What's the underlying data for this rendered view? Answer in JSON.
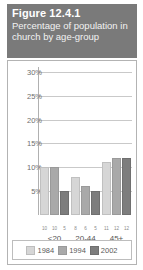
{
  "figure": {
    "number": "Figure 12.4.1",
    "subtitle": "Percentage of population in church by age-group"
  },
  "legend": {
    "items": [
      {
        "label": "1984",
        "color": "#d6d6d6",
        "name": "legend-item-1984"
      },
      {
        "label": "1994",
        "color": "#a9a9a9",
        "name": "legend-item-1994"
      },
      {
        "label": "2002",
        "color": "#7d7d7d",
        "name": "legend-item-2002"
      }
    ]
  },
  "chart_data": {
    "type": "bar",
    "title": "Percentage of population in church by age-group",
    "xlabel": "",
    "ylabel": "",
    "categories": [
      "<20",
      "20-44",
      "45+"
    ],
    "series": [
      {
        "name": "1984",
        "color": "#d6d6d6",
        "values": [
          10,
          8,
          11
        ]
      },
      {
        "name": "1994",
        "color": "#a9a9a9",
        "values": [
          10,
          6,
          12
        ]
      },
      {
        "name": "2002",
        "color": "#7d7d7d",
        "values": [
          5,
          5,
          12
        ]
      }
    ],
    "data_labels": [
      [
        "10",
        "10",
        "5"
      ],
      [
        "8",
        "6",
        "5"
      ],
      [
        "11",
        "12",
        "12"
      ]
    ],
    "ylim": [
      0,
      31
    ],
    "yticks": [
      5,
      10,
      15,
      20,
      25,
      30
    ],
    "ytick_labels": [
      "5%",
      "10%",
      "15%",
      "20%",
      "25%",
      "30%"
    ],
    "grid": true,
    "legend_position": "bottom"
  }
}
